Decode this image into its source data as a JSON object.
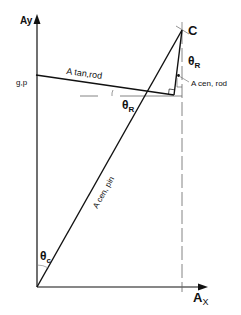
{
  "diagram": {
    "axes": {
      "y_label": "Ay",
      "x_label_main": "A",
      "x_label_sub": "X"
    },
    "points": {
      "top": "C",
      "origin_left_label": "g,p"
    },
    "vectors": {
      "tan_rod": "A tan,rod",
      "cen_rod": "A cen, rod",
      "cen_pin": "A cen, pin"
    },
    "angles": {
      "theta_r_main": "θ",
      "theta_r_sub": "R",
      "theta_r2_main": "θ",
      "theta_r2_sub": "R",
      "theta_c_main": "θ",
      "theta_c_sub": "c"
    },
    "colors": {
      "line": "#111111",
      "guide": "#777777",
      "background": "#ffffff"
    }
  }
}
